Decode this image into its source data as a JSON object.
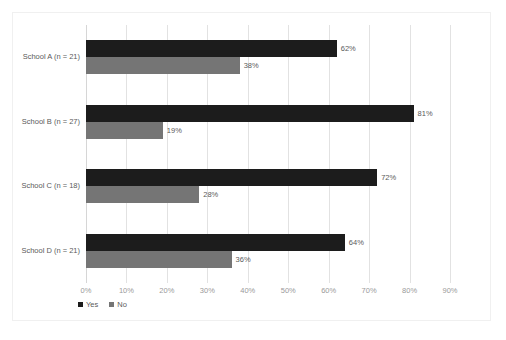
{
  "chart_data": {
    "type": "bar",
    "orientation": "horizontal",
    "title": "",
    "subtitle": "",
    "xlabel": "",
    "ylabel": "",
    "categories": [
      "School A (n = 21)",
      "School B (n = 27)",
      "School C (n = 18)",
      "School D (n = 21)"
    ],
    "series": [
      {
        "name": "Yes",
        "color": "#1c1c1c",
        "values": [
          62,
          81,
          72,
          64
        ],
        "labels": [
          "62%",
          "81%",
          "72%",
          "64%"
        ]
      },
      {
        "name": "No",
        "color": "#757575",
        "values": [
          38,
          19,
          28,
          36
        ],
        "labels": [
          "38%",
          "19%",
          "28%",
          "36%"
        ]
      }
    ],
    "xlim": [
      0,
      90
    ],
    "xticks": [
      0,
      10,
      20,
      30,
      40,
      50,
      60,
      70,
      80,
      90
    ],
    "xtick_labels": [
      "0%",
      "10%",
      "20%",
      "30%",
      "40%",
      "50%",
      "60%",
      "70%",
      "80%",
      "90%"
    ],
    "grid": {
      "vertical": true,
      "horizontal": false
    },
    "legend": {
      "position": "bottom-left",
      "entries": [
        "Yes",
        "No"
      ]
    },
    "value_label_suffix": "%"
  },
  "colors": {
    "yes": "#1c1c1c",
    "no": "#757575",
    "gridline": "#e2e2e2",
    "axis": "#d6d6d6",
    "tick_text": "#9a9a9a",
    "label_text": "#5a5a5a",
    "frame": "#f0f0f0",
    "background": "#ffffff"
  }
}
